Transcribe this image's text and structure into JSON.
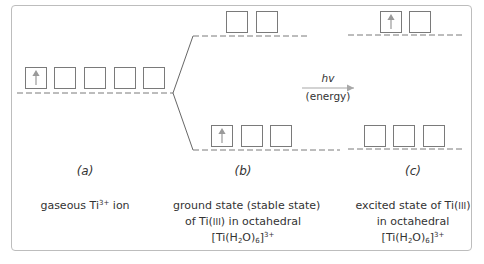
{
  "diagram": {
    "colors": {
      "box_stroke": "#7a7a7a",
      "arrow": "#a8a8a8",
      "dashed_line": "#7a7a7a",
      "frame": "#bdbdbd"
    },
    "panels": [
      {
        "tag": "(a)",
        "tag_letter": "a",
        "caption_lines": [
          "gaseous Ti",
          "3+",
          " ion"
        ],
        "orbitals": [
          {
            "level": "degenerate d",
            "boxes": 5,
            "electrons": [
              1,
              0,
              0,
              0,
              0
            ]
          }
        ]
      },
      {
        "tag": "(b)",
        "tag_letter": "b",
        "caption": {
          "line1": "ground state (stable state)",
          "line2_a": "of Ti(",
          "line2_roman": "III",
          "line2_b": ") in octahedral",
          "line3_a": "[Ti(H",
          "line3_sub1": "2",
          "line3_b": "O)",
          "line3_sub2": "6",
          "line3_c": "]",
          "line3_sup": "3+"
        },
        "orbitals": [
          {
            "level": "eg",
            "boxes": 2,
            "electrons": [
              0,
              0
            ]
          },
          {
            "level": "t2g",
            "boxes": 3,
            "electrons": [
              1,
              0,
              0
            ]
          }
        ]
      },
      {
        "tag": "(c)",
        "tag_letter": "c",
        "caption": {
          "line1_a": "excited state of Ti(",
          "line1_roman": "III",
          "line1_b": ")",
          "line2": "in octahedral",
          "line3_a": "[Ti(H",
          "line3_sub1": "2",
          "line3_b": "O)",
          "line3_sub2": "6",
          "line3_c": "]",
          "line3_sup": "3+"
        },
        "orbitals": [
          {
            "level": "eg",
            "boxes": 2,
            "electrons": [
              1,
              0
            ]
          },
          {
            "level": "t2g",
            "boxes": 3,
            "electrons": [
              0,
              0,
              0
            ]
          }
        ]
      }
    ],
    "transition": {
      "label_top": "hv",
      "label_bottom": "(energy)"
    },
    "gaseous": {
      "text_a": "gaseous Ti",
      "sup": "3+",
      "text_b": " ion"
    }
  }
}
